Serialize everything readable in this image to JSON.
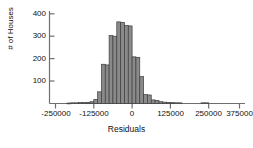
{
  "chart_data": {
    "type": "bar",
    "title": "",
    "subtitle": "",
    "xlabel": "Residuals",
    "ylabel": "# of Houses",
    "xlim": [
      -287500,
      400000
    ],
    "ylim": [
      0,
      420
    ],
    "grid": false,
    "legend": null,
    "bin_width": 12500,
    "xticks": [
      -250000,
      -125000,
      0,
      125000,
      250000,
      375000
    ],
    "xtick_labels": [
      "-250000",
      "-125000",
      "0",
      "125000",
      "250000",
      "375000"
    ],
    "yticks": [
      100,
      200,
      300,
      400
    ],
    "ytick_labels": [
      "100",
      "200",
      "300",
      "400"
    ],
    "bar_color": "#8a8a8a",
    "bar_edge_color": "#3d3d3d",
    "axis_color": "#6e6e6e",
    "bins": [
      {
        "x0": -212500,
        "x1": -200000,
        "value": 2
      },
      {
        "x0": -200000,
        "x1": -187500,
        "value": 3
      },
      {
        "x0": -187500,
        "x1": -175000,
        "value": 3
      },
      {
        "x0": -175000,
        "x1": -162500,
        "value": 4
      },
      {
        "x0": -162500,
        "x1": -150000,
        "value": 4
      },
      {
        "x0": -150000,
        "x1": -137500,
        "value": 5
      },
      {
        "x0": -137500,
        "x1": -125000,
        "value": 8
      },
      {
        "x0": -125000,
        "x1": -112500,
        "value": 18
      },
      {
        "x0": -112500,
        "x1": -100000,
        "value": 52
      },
      {
        "x0": -100000,
        "x1": -87500,
        "value": 175
      },
      {
        "x0": -87500,
        "x1": -75000,
        "value": 172
      },
      {
        "x0": -75000,
        "x1": -62500,
        "value": 303
      },
      {
        "x0": -62500,
        "x1": -50000,
        "value": 300
      },
      {
        "x0": -50000,
        "x1": -37500,
        "value": 364
      },
      {
        "x0": -37500,
        "x1": -25000,
        "value": 362
      },
      {
        "x0": -25000,
        "x1": -12500,
        "value": 348
      },
      {
        "x0": -12500,
        "x1": 0,
        "value": 346
      },
      {
        "x0": 0,
        "x1": 12500,
        "value": 208
      },
      {
        "x0": 12500,
        "x1": 25000,
        "value": 206
      },
      {
        "x0": 25000,
        "x1": 37500,
        "value": 120
      },
      {
        "x0": 37500,
        "x1": 50000,
        "value": 40
      },
      {
        "x0": 50000,
        "x1": 62500,
        "value": 38
      },
      {
        "x0": 62500,
        "x1": 75000,
        "value": 16
      },
      {
        "x0": 75000,
        "x1": 87500,
        "value": 14
      },
      {
        "x0": 87500,
        "x1": 100000,
        "value": 8
      },
      {
        "x0": 100000,
        "x1": 112500,
        "value": 6
      },
      {
        "x0": 112500,
        "x1": 125000,
        "value": 5
      },
      {
        "x0": 125000,
        "x1": 137500,
        "value": 4
      },
      {
        "x0": 137500,
        "x1": 150000,
        "value": 3
      },
      {
        "x0": 150000,
        "x1": 162500,
        "value": 3
      },
      {
        "x0": 225000,
        "x1": 237500,
        "value": 3
      },
      {
        "x0": 237500,
        "x1": 250000,
        "value": 3
      }
    ]
  }
}
